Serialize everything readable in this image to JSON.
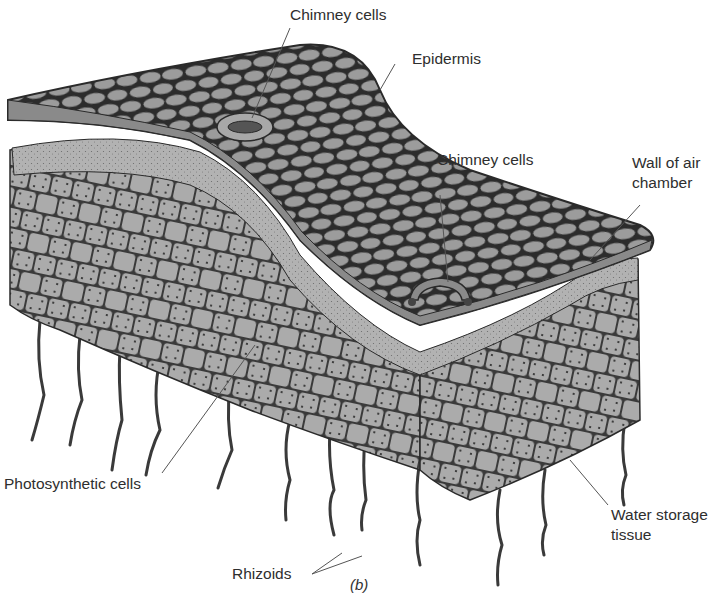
{
  "figure": {
    "caption": "(b)",
    "colors": {
      "cell_fill": "#9a9a9a",
      "cell_outline": "#2a2a2a",
      "tissue_fill": "#b4b4b4",
      "background": "#ffffff"
    }
  },
  "labels": {
    "chimney_cells_top": "Chimney cells",
    "epidermis": "Epidermis",
    "chimney_cells_right": "Chimney cells",
    "wall_of_air_chamber_line1": "Wall of air",
    "wall_of_air_chamber_line2": "chamber",
    "photosynthetic_cells": "Photosynthetic cells",
    "water_storage_tissue_line1": "Water storage",
    "water_storage_tissue_line2": "tissue",
    "rhizoids": "Rhizoids"
  }
}
